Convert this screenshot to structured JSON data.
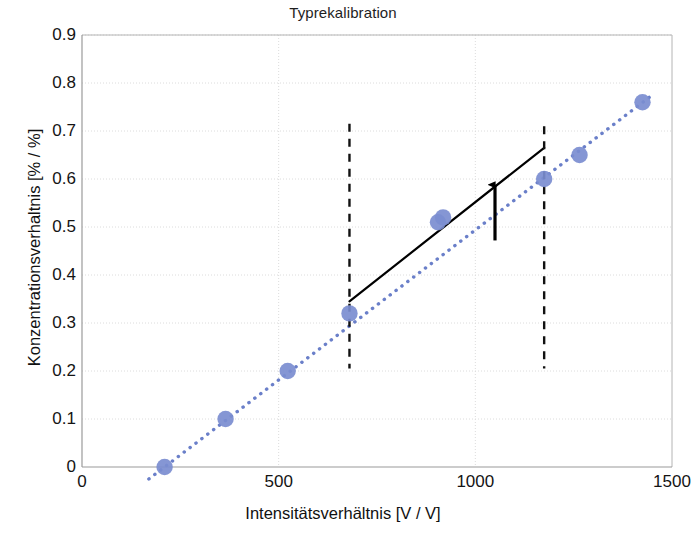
{
  "chart_data": {
    "type": "scatter",
    "title": "Typrekalibration",
    "xlabel": "Intensitätsverhältnis [V / V]",
    "ylabel": "Konzentrationsverhaltnis [% / %]",
    "xlim": [
      0,
      1500
    ],
    "ylim": [
      0,
      0.9
    ],
    "xticks": [
      "0",
      "500",
      "1000",
      "1500"
    ],
    "xtick_values": [
      0,
      500,
      1000,
      1500
    ],
    "yticks": [
      "0",
      "0.1",
      "0.2",
      "0.3",
      "0.4",
      "0.5",
      "0.6",
      "0.7",
      "0.8",
      "0.9"
    ],
    "ytick_values": [
      0,
      0.1,
      0.2,
      0.3,
      0.4,
      0.5,
      0.6,
      0.7,
      0.8,
      0.9
    ],
    "grid": true,
    "legend": false,
    "series": [
      {
        "name": "Kalibrierpunkte",
        "type": "scatter",
        "marker": "circle",
        "color": "#7b8dd0",
        "points": [
          {
            "x": 210,
            "y": 0.0
          },
          {
            "x": 365,
            "y": 0.1
          },
          {
            "x": 523,
            "y": 0.2
          },
          {
            "x": 680,
            "y": 0.32
          },
          {
            "x": 905,
            "y": 0.51
          },
          {
            "x": 918,
            "y": 0.52
          },
          {
            "x": 1175,
            "y": 0.6
          },
          {
            "x": 1265,
            "y": 0.65
          },
          {
            "x": 1425,
            "y": 0.76
          }
        ]
      },
      {
        "name": "Regressionsgerade (gepunktet)",
        "type": "line",
        "style": "dotted",
        "color": "#6a7fc9",
        "points": [
          {
            "x": 170,
            "y": -0.025
          },
          {
            "x": 1450,
            "y": 0.775
          }
        ]
      },
      {
        "name": "Typkalibrationsgerade (durchgezogen)",
        "type": "line",
        "style": "solid",
        "color": "#000000",
        "points": [
          {
            "x": 680,
            "y": 0.345
          },
          {
            "x": 1175,
            "y": 0.665
          }
        ]
      }
    ],
    "annotations": [
      {
        "name": "dashed-vertical-left",
        "type": "vline",
        "x": 680,
        "y_from": 0.205,
        "y_to": 0.715,
        "style": "dashed",
        "color": "#111111"
      },
      {
        "name": "dashed-vertical-right",
        "type": "vline",
        "x": 1175,
        "y_from": 0.205,
        "y_to": 0.71,
        "style": "dashed",
        "color": "#111111"
      },
      {
        "name": "offset-arrow",
        "type": "arrow",
        "x": 1050,
        "y_from": 0.472,
        "y_to": 0.588,
        "direction": "up",
        "color": "#000000"
      }
    ],
    "colors": {
      "marker": "#7b8dd0",
      "dotted_line": "#6a7fc9",
      "solid_line": "#000000",
      "grid": "#dcdcdc",
      "axis": "#b4b4b4",
      "text": "#141414"
    }
  }
}
